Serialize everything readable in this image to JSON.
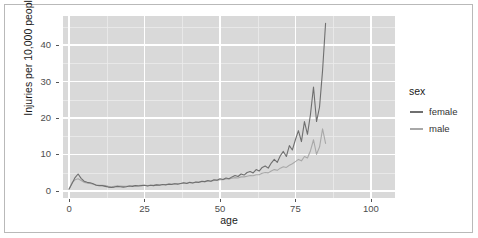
{
  "chart_data": {
    "type": "line",
    "title": "",
    "xlabel": "age",
    "ylabel": "Injuries per 10,000 people",
    "xlim": [
      -2,
      108
    ],
    "ylim": [
      -2,
      48
    ],
    "x_ticks": [
      0,
      25,
      50,
      75,
      100
    ],
    "y_ticks": [
      0,
      10,
      20,
      30,
      40
    ],
    "grid": true,
    "legend": {
      "title": "sex",
      "position": "right",
      "entries": [
        {
          "label": "female",
          "color": "#6f6f6f"
        },
        {
          "label": "male",
          "color": "#a8a8a8"
        }
      ]
    },
    "x": [
      0,
      1,
      2,
      3,
      4,
      5,
      6,
      7,
      8,
      9,
      10,
      11,
      12,
      13,
      14,
      15,
      16,
      17,
      18,
      19,
      20,
      21,
      22,
      23,
      24,
      25,
      26,
      27,
      28,
      29,
      30,
      31,
      32,
      33,
      34,
      35,
      36,
      37,
      38,
      39,
      40,
      41,
      42,
      43,
      44,
      45,
      46,
      47,
      48,
      49,
      50,
      51,
      52,
      53,
      54,
      55,
      56,
      57,
      58,
      59,
      60,
      61,
      62,
      63,
      64,
      65,
      66,
      67,
      68,
      69,
      70,
      71,
      72,
      73,
      74,
      75,
      76,
      77,
      78,
      79,
      80,
      81,
      82,
      83,
      84,
      85
    ],
    "series": [
      {
        "name": "female",
        "color": "#6f6f6f",
        "values": [
          0.4,
          2.0,
          3.6,
          4.6,
          3.4,
          2.6,
          2.3,
          2.2,
          1.9,
          1.5,
          1.4,
          1.4,
          1.2,
          1.0,
          0.9,
          1.0,
          1.2,
          1.1,
          1.0,
          1.1,
          1.3,
          1.2,
          1.4,
          1.3,
          1.4,
          1.5,
          1.3,
          1.5,
          1.4,
          1.6,
          1.5,
          1.7,
          1.6,
          1.8,
          1.7,
          1.9,
          1.8,
          2.0,
          2.2,
          2.0,
          2.3,
          2.1,
          2.4,
          2.3,
          2.6,
          2.5,
          2.8,
          2.6,
          3.0,
          2.9,
          3.3,
          3.1,
          3.5,
          3.3,
          3.8,
          4.2,
          3.9,
          4.6,
          4.3,
          5.0,
          5.3,
          4.9,
          5.8,
          5.4,
          6.4,
          6.8,
          6.2,
          7.6,
          8.6,
          7.8,
          9.6,
          10.8,
          9.4,
          12.4,
          11.2,
          14.0,
          16.5,
          13.5,
          19.0,
          15.5,
          21.0,
          28.5,
          19.0,
          23.0,
          33.0,
          46.0
        ]
      },
      {
        "name": "male",
        "color": "#a8a8a8",
        "values": [
          0.5,
          2.2,
          3.0,
          3.3,
          2.8,
          2.3,
          2.1,
          2.0,
          1.8,
          1.6,
          1.5,
          1.5,
          1.4,
          1.2,
          1.1,
          1.2,
          1.3,
          1.3,
          1.2,
          1.2,
          1.3,
          1.3,
          1.4,
          1.4,
          1.5,
          1.5,
          1.4,
          1.5,
          1.5,
          1.6,
          1.6,
          1.7,
          1.7,
          1.8,
          1.8,
          1.9,
          1.9,
          2.0,
          2.1,
          2.1,
          2.2,
          2.2,
          2.3,
          2.3,
          2.5,
          2.5,
          2.6,
          2.6,
          2.8,
          2.8,
          3.0,
          3.0,
          3.2,
          3.2,
          3.4,
          3.6,
          3.5,
          3.8,
          3.8,
          4.0,
          4.2,
          4.1,
          4.4,
          4.4,
          4.8,
          5.0,
          4.9,
          5.4,
          5.8,
          5.6,
          6.2,
          6.6,
          6.4,
          7.0,
          7.4,
          8.0,
          8.6,
          8.2,
          9.4,
          9.0,
          11.0,
          14.0,
          10.0,
          12.0,
          17.0,
          13.0
        ]
      }
    ]
  }
}
